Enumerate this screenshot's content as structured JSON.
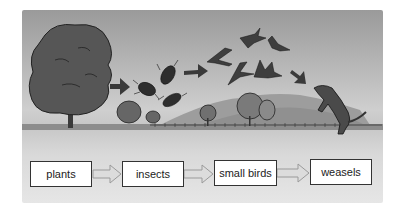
{
  "diagram": {
    "type": "food-chain",
    "nodes": [
      {
        "id": "plants",
        "label": "plants"
      },
      {
        "id": "insects",
        "label": "insects"
      },
      {
        "id": "small_birds",
        "label": "small birds"
      },
      {
        "id": "weasels",
        "label": "weasels"
      }
    ],
    "edges": [
      {
        "from": "plants",
        "to": "insects"
      },
      {
        "from": "insects",
        "to": "small_birds"
      },
      {
        "from": "small_birds",
        "to": "weasels"
      }
    ],
    "illustration": {
      "elements": [
        "tree",
        "insects",
        "birds",
        "weasel",
        "hills",
        "bushes",
        "fence"
      ],
      "arrow_color": "#3a3a3a"
    },
    "colors": {
      "box_fill": "#ffffff",
      "box_border": "#333333",
      "connector": "#a8a8a8"
    }
  }
}
